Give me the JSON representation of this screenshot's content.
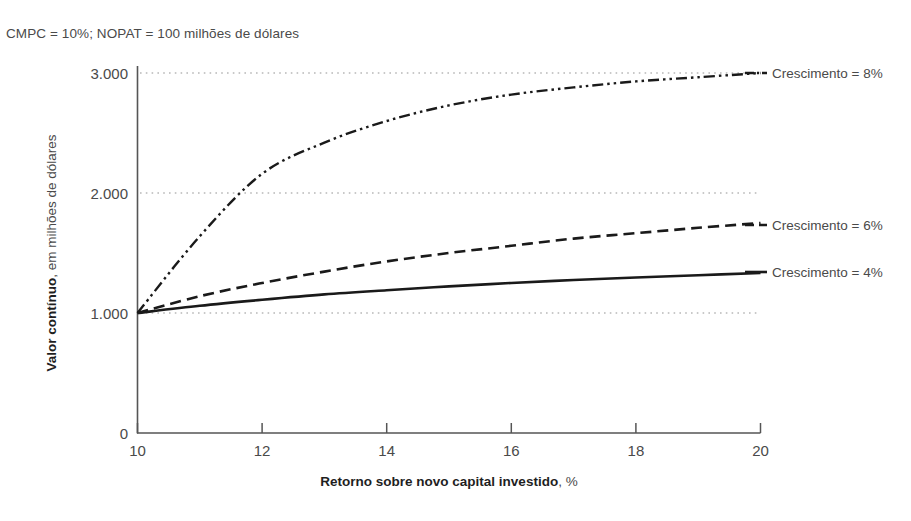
{
  "note": "CMPC = 10%; NOPAT = 100 milhões de dólares",
  "axes": {
    "x_title_bold": "Retorno sobre novo capital investido",
    "x_title_rest": ", %",
    "y_title_bold": "Valor contínuo",
    "y_title_rest": ", em milhões de dólares",
    "x_ticks": [
      "10",
      "12",
      "14",
      "16",
      "18",
      "20"
    ],
    "y_ticks": [
      "0",
      "1.000",
      "2.000",
      "3.000"
    ]
  },
  "legend": {
    "items": [
      {
        "label": "Crescimento = 8%"
      },
      {
        "label": "Crescimento = 6%"
      },
      {
        "label": "Crescimento = 4%"
      }
    ]
  },
  "colors": {
    "line": "#1a1a1a",
    "axis": "#555555",
    "grid": "#b8b8b8",
    "text": "#4a4a4a"
  },
  "chart_data": {
    "type": "line",
    "title": "",
    "subtitle": "CMPC = 10%; NOPAT = 100 milhões de dólares",
    "xlabel": "Retorno sobre novo capital investido, %",
    "ylabel": "Valor contínuo, em milhões de dólares",
    "xlim": [
      10,
      20
    ],
    "ylim": [
      0,
      3000
    ],
    "xticks": [
      10,
      12,
      14,
      16,
      18,
      20
    ],
    "yticks": [
      0,
      1000,
      2000,
      3000
    ],
    "grid": "horizontal-dotted",
    "legend_position": "right-inline",
    "x": [
      10,
      11,
      12,
      13,
      14,
      15,
      16,
      17,
      18,
      19,
      20
    ],
    "series": [
      {
        "name": "Crescimento = 8%",
        "style": "dash-dot-dot",
        "values": [
          1000,
          1636,
          2167,
          2615,
          3000,
          3333,
          3625,
          3882,
          4111,
          4316,
          4500
        ],
        "values_plotted": [
          1000,
          1640,
          2160,
          2420,
          2600,
          2730,
          2820,
          2880,
          2930,
          2965,
          3000
        ]
      },
      {
        "name": "Crescimento = 6%",
        "style": "dashed",
        "values": [
          1000,
          1136,
          1250,
          1346,
          1429,
          1500,
          1563,
          1618,
          1667,
          1711,
          1750
        ],
        "values_plotted": [
          1000,
          1140,
          1250,
          1345,
          1430,
          1500,
          1560,
          1620,
          1665,
          1710,
          1750
        ]
      },
      {
        "name": "Crescimento = 4%",
        "style": "solid",
        "values": [
          1000,
          1061,
          1111,
          1154,
          1190,
          1222,
          1250,
          1275,
          1296,
          1316,
          1333
        ],
        "values_plotted": [
          1000,
          1060,
          1110,
          1155,
          1190,
          1222,
          1250,
          1275,
          1296,
          1315,
          1333
        ]
      }
    ]
  }
}
